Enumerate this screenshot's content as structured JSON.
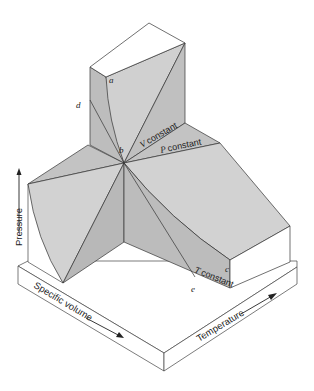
{
  "diagram": {
    "axes": {
      "vertical": "Pressure",
      "left_base": "Specific volume",
      "right_base": "Temperature"
    },
    "point_labels": {
      "a": "a",
      "b": "b",
      "c": "c",
      "d": "d",
      "e": "e"
    },
    "line_labels": {
      "v_constant": "V constant",
      "v_italic": "V",
      "p_constant": "P constant",
      "p_italic": "P",
      "t_constant": "T constant",
      "t_italic": "T",
      "constant_word": "constant"
    },
    "colors": {
      "face_light": "#d2d2d2",
      "face_mid": "#c3c3c3",
      "face_dark": "#b5b5b5",
      "top_face": "#ffffff",
      "line": "#333333",
      "background": "#ffffff"
    }
  }
}
